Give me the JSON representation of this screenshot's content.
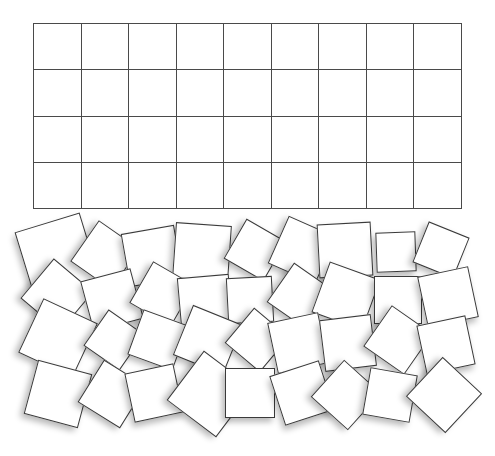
{
  "grid": {
    "left": 33,
    "top": 23,
    "width": 429,
    "height": 186,
    "columns": 9,
    "rows": 4,
    "line_color": "#4a4a4a"
  },
  "tiles": {
    "fill_color": "#ffffff",
    "border_color": "#3a3a3a",
    "count": 36,
    "items": [
      {
        "cx": 57,
        "cy": 255,
        "size": 68,
        "rot": -17
      },
      {
        "cx": 105,
        "cy": 255,
        "size": 50,
        "rot": 35
      },
      {
        "cx": 152,
        "cy": 256,
        "size": 54,
        "rot": -10
      },
      {
        "cx": 202,
        "cy": 252,
        "size": 56,
        "rot": 4
      },
      {
        "cx": 255,
        "cy": 250,
        "size": 46,
        "rot": 30
      },
      {
        "cx": 302,
        "cy": 250,
        "size": 52,
        "rot": 24
      },
      {
        "cx": 345,
        "cy": 250,
        "size": 54,
        "rot": -3
      },
      {
        "cx": 396,
        "cy": 252,
        "size": 40,
        "rot": -2
      },
      {
        "cx": 441,
        "cy": 250,
        "size": 44,
        "rot": 22
      },
      {
        "cx": 57,
        "cy": 295,
        "size": 52,
        "rot": 40
      },
      {
        "cx": 112,
        "cy": 300,
        "size": 52,
        "rot": -15
      },
      {
        "cx": 162,
        "cy": 294,
        "size": 48,
        "rot": 30
      },
      {
        "cx": 205,
        "cy": 302,
        "size": 52,
        "rot": -5
      },
      {
        "cx": 250,
        "cy": 300,
        "size": 46,
        "rot": -3
      },
      {
        "cx": 300,
        "cy": 296,
        "size": 48,
        "rot": 35
      },
      {
        "cx": 346,
        "cy": 296,
        "size": 54,
        "rot": 20
      },
      {
        "cx": 398,
        "cy": 300,
        "size": 48,
        "rot": 0
      },
      {
        "cx": 448,
        "cy": 297,
        "size": 52,
        "rot": -12
      },
      {
        "cx": 58,
        "cy": 338,
        "size": 60,
        "rot": 25
      },
      {
        "cx": 114,
        "cy": 340,
        "size": 44,
        "rot": 35
      },
      {
        "cx": 158,
        "cy": 340,
        "size": 48,
        "rot": 20
      },
      {
        "cx": 208,
        "cy": 340,
        "size": 54,
        "rot": 22
      },
      {
        "cx": 257,
        "cy": 340,
        "size": 46,
        "rot": 40
      },
      {
        "cx": 298,
        "cy": 343,
        "size": 52,
        "rot": -12
      },
      {
        "cx": 348,
        "cy": 343,
        "size": 52,
        "rot": -7
      },
      {
        "cx": 398,
        "cy": 340,
        "size": 50,
        "rot": 35
      },
      {
        "cx": 446,
        "cy": 345,
        "size": 50,
        "rot": -12
      },
      {
        "cx": 58,
        "cy": 394,
        "size": 56,
        "rot": 15
      },
      {
        "cx": 112,
        "cy": 394,
        "size": 50,
        "rot": 32
      },
      {
        "cx": 154,
        "cy": 393,
        "size": 50,
        "rot": -12
      },
      {
        "cx": 210,
        "cy": 394,
        "size": 62,
        "rot": 37
      },
      {
        "cx": 250,
        "cy": 393,
        "size": 50,
        "rot": 0
      },
      {
        "cx": 302,
        "cy": 393,
        "size": 52,
        "rot": -18
      },
      {
        "cx": 346,
        "cy": 395,
        "size": 50,
        "rot": 42
      },
      {
        "cx": 390,
        "cy": 395,
        "size": 48,
        "rot": 10
      },
      {
        "cx": 444,
        "cy": 395,
        "size": 54,
        "rot": 43
      }
    ]
  }
}
